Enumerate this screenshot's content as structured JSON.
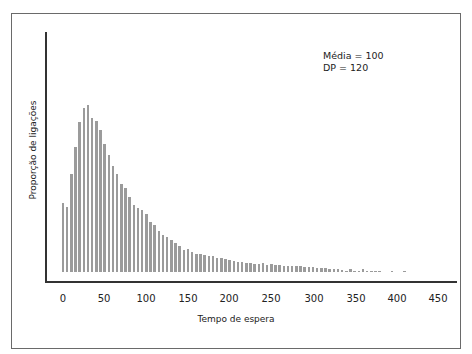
{
  "chart_data": {
    "type": "bar",
    "title": "",
    "xlabel": "Tempo de espera",
    "ylabel": "Proporção de ligações",
    "xlim": [
      0,
      450
    ],
    "x_ticks": [
      0,
      50,
      100,
      150,
      200,
      250,
      300,
      350,
      400,
      450
    ],
    "bin_width": 5,
    "annotations": [
      "Média = 100",
      "DP = 120"
    ],
    "grid": false,
    "x": [
      0,
      5,
      10,
      15,
      20,
      25,
      30,
      35,
      40,
      45,
      50,
      55,
      60,
      65,
      70,
      75,
      80,
      85,
      90,
      95,
      100,
      105,
      110,
      115,
      120,
      125,
      130,
      135,
      140,
      145,
      150,
      155,
      160,
      165,
      170,
      175,
      180,
      185,
      190,
      195,
      200,
      205,
      210,
      215,
      220,
      225,
      230,
      235,
      240,
      245,
      250,
      255,
      260,
      265,
      270,
      275,
      280,
      285,
      290,
      295,
      300,
      305,
      310,
      315,
      320,
      325,
      330,
      335,
      340,
      345,
      350,
      355,
      360,
      365,
      370,
      375,
      380,
      385,
      390,
      395,
      400,
      405,
      410,
      415
    ],
    "values": [
      69,
      65,
      98,
      125,
      150,
      164,
      167,
      154,
      151,
      142,
      128,
      117,
      106,
      98,
      88,
      84,
      75,
      67,
      64,
      62,
      58,
      50,
      47,
      41,
      37,
      35,
      32,
      29,
      26,
      22,
      23,
      20,
      18,
      18,
      17,
      16,
      16,
      14,
      14,
      13,
      12,
      11,
      10,
      10,
      9,
      9,
      8,
      8,
      9,
      7,
      8,
      7,
      7,
      6,
      6,
      6,
      6,
      6,
      5,
      5,
      5,
      4,
      4,
      4,
      3,
      3,
      3,
      2,
      1,
      3,
      1,
      1,
      3,
      1,
      1,
      1,
      1,
      0,
      0,
      1,
      0,
      0,
      1,
      0
    ],
    "units_note": "relative bar heights (px-scale, y axis unlabeled)"
  },
  "annotation": {
    "mean": "Média = 100",
    "sd": "DP = 120"
  },
  "axes": {
    "xlabel": "Tempo de espera",
    "ylabel": "Proporção de ligações",
    "ticks": [
      "0",
      "50",
      "100",
      "150",
      "200",
      "250",
      "300",
      "350",
      "400",
      "450"
    ]
  }
}
